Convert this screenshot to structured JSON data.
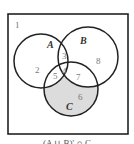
{
  "diagram": {
    "type": "venn",
    "sets": [
      {
        "name": "A",
        "label": "A"
      },
      {
        "name": "B",
        "label": "B"
      },
      {
        "name": "C",
        "label": "C"
      }
    ],
    "regions": [
      {
        "id": "1",
        "label": "1",
        "description": "outside all sets"
      },
      {
        "id": "2",
        "label": "2",
        "description": "A only"
      },
      {
        "id": "3",
        "label": "3",
        "description": "A and B only"
      },
      {
        "id": "4",
        "label": "4",
        "description": "A and B and C"
      },
      {
        "id": "5",
        "label": "5",
        "description": "A and C only"
      },
      {
        "id": "6",
        "label": "6",
        "description": "C only",
        "shaded": true
      },
      {
        "id": "7",
        "label": "7",
        "description": "B and C only"
      },
      {
        "id": "8",
        "label": "8",
        "description": "B only"
      }
    ],
    "shade_color": "#dcdcdc",
    "caption": "(A ∪ B)' ∩ C"
  }
}
